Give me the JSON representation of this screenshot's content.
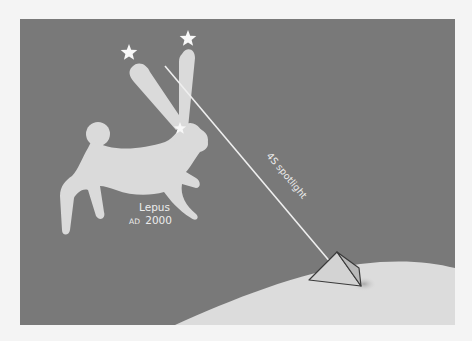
{
  "figure": {
    "background_color": "#797979",
    "page_color": "#f4f4f4",
    "ground_color": "#dcdcdc",
    "figure_color": "#dadada",
    "beam_color": "#efefef",
    "pyramid_face_color": "#cfcfcf",
    "pyramid_edge_color": "#3a3a3a"
  },
  "labels": {
    "constellation_name": "Lepus",
    "epoch_prefix": "AD",
    "epoch_year": "2000",
    "beam_label": "4S spotlight"
  },
  "elements": {
    "constellation": "hare",
    "stars": 3,
    "structure": "pyramid"
  }
}
